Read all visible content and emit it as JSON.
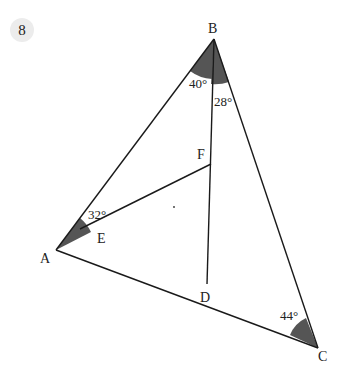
{
  "problem_number": "8",
  "points": {
    "A": {
      "label": "A",
      "x": 56,
      "y": 250
    },
    "B": {
      "label": "B",
      "x": 214,
      "y": 39
    },
    "C": {
      "label": "C",
      "x": 318,
      "y": 348
    },
    "D": {
      "label": "D",
      "x": 207,
      "y": 284
    },
    "E": {
      "label": "E",
      "x": 104,
      "y": 224
    },
    "F": {
      "label": "F",
      "x": 211,
      "y": 164
    }
  },
  "angles": {
    "A": "32°",
    "B_left": "40°",
    "B_right": "28°",
    "C": "44°"
  },
  "colors": {
    "line": "#1a1a1a",
    "sector": "#555555",
    "badge_bg": "#ececec"
  }
}
